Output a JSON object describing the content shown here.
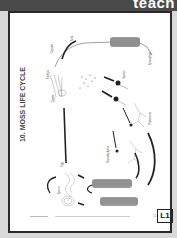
{
  "header": {
    "brand_text": "teach",
    "bar_color": "#4a4a4a"
  },
  "card": {
    "title": "10. MOSS LIFE CYCLE",
    "badge": "L1",
    "page_number": "10",
    "labels": {
      "seta": "Seta",
      "capsule": "Capsule",
      "sporophyte": "Sporophyte",
      "embryo": "Embryo",
      "zygote": "Zygote",
      "spores": "Spores",
      "protonema": "Protonema",
      "gametophytes": "Gametophytes",
      "egg": "Egg",
      "sperm": "Sperm"
    }
  }
}
